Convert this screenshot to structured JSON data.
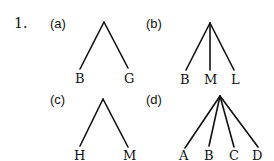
{
  "question_number": "1.",
  "trees": [
    {
      "label": "(a)",
      "leaves": [
        "B",
        "G"
      ]
    },
    {
      "label": "(b)",
      "leaves": [
        "B",
        "M",
        "L"
      ]
    },
    {
      "label": "(c)",
      "leaves": [
        "H",
        "M"
      ]
    },
    {
      "label": "(d)",
      "leaves": [
        "A",
        "B",
        "C",
        "D"
      ]
    }
  ]
}
